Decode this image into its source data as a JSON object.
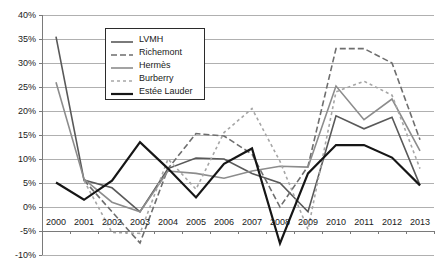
{
  "chart_data": {
    "type": "line",
    "title": "",
    "xlabel": "",
    "ylabel": "",
    "grid": true,
    "legend_position": "top-center-inside",
    "categories": [
      "2000",
      "2001",
      "2002",
      "2003",
      "2004",
      "2005",
      "2006",
      "2007",
      "2008",
      "2009",
      "2010",
      "2011",
      "2012",
      "2013"
    ],
    "x": [
      2000,
      2001,
      2002,
      2003,
      2004,
      2005,
      2006,
      2007,
      2008,
      2009,
      2010,
      2011,
      2012,
      2013
    ],
    "ylim": [
      -10,
      40
    ],
    "ytick_values": [
      40,
      35,
      30,
      25,
      20,
      15,
      10,
      5,
      0,
      -5,
      -10
    ],
    "ytick_labels": [
      "40%",
      "35%",
      "30%",
      "25%",
      "20%",
      "15%",
      "10%",
      "5%",
      "0%",
      "-5%",
      "-10%"
    ],
    "xtick_labels": [
      "2000",
      "2001",
      "2002",
      "2003",
      "2004",
      "2005",
      "2006",
      "2007",
      "2008",
      "2009",
      "2010",
      "2011",
      "2012",
      "2013"
    ],
    "series": [
      {
        "name": "LVMH",
        "color": "#595959",
        "dash": "solid",
        "width": 1.6,
        "values": [
          35.5,
          5.6,
          4.0,
          -1.0,
          8.0,
          10.2,
          10.0,
          7.0,
          5.0,
          -1.0,
          19.0,
          16.3,
          18.7,
          4.5
        ]
      },
      {
        "name": "Richemont",
        "color": "#6e6e6e",
        "dash": "dashed",
        "width": 1.6,
        "values": [
          null,
          5.6,
          -1.0,
          -7.5,
          8.0,
          15.3,
          14.8,
          11.0,
          0.0,
          8.5,
          33.0,
          33.0,
          30.0,
          14.0
        ]
      },
      {
        "name": "Hermès",
        "color": "#8c8c8c",
        "dash": "solid",
        "width": 1.6,
        "values": [
          26.0,
          5.8,
          1.0,
          -1.0,
          7.5,
          7.0,
          6.0,
          7.5,
          8.5,
          8.3,
          25.2,
          18.2,
          22.5,
          11.7
        ]
      },
      {
        "name": "Burberry",
        "color": "#a6a6a6",
        "dash": "dotted",
        "width": 1.6,
        "values": [
          null,
          5.5,
          -5.3,
          -5.5,
          10.0,
          3.7,
          15.5,
          20.5,
          9.5,
          -4.7,
          24.0,
          26.2,
          23.3,
          8.0
        ]
      },
      {
        "name": "Estée Lauder",
        "color": "#161616",
        "dash": "solid",
        "width": 2.2,
        "values": [
          5.1,
          1.5,
          5.5,
          13.5,
          8.0,
          2.0,
          9.0,
          12.2,
          -7.6,
          7.0,
          12.9,
          12.9,
          10.3,
          4.5
        ]
      }
    ],
    "legend": [
      {
        "label": "LVMH",
        "color": "#595959",
        "dash": "solid",
        "width": 1.6
      },
      {
        "label": "Richemont",
        "color": "#6e6e6e",
        "dash": "dashed",
        "width": 1.6
      },
      {
        "label": "Hermès",
        "color": "#8c8c8c",
        "dash": "solid",
        "width": 1.6
      },
      {
        "label": "Burberry",
        "color": "#a6a6a6",
        "dash": "dotted",
        "width": 1.6
      },
      {
        "label": "Estée Lauder",
        "color": "#161616",
        "dash": "solid",
        "width": 2.2
      }
    ],
    "colors": {
      "grid": "#b0b0b0",
      "axis": "#7a7a7a",
      "text": "#1a1a1a",
      "background": "#ffffff",
      "legend_border": "#2b2b2b"
    }
  },
  "geometry": {
    "plot_left": 42,
    "plot_right": 434,
    "plot_top": 15,
    "plot_bottom": 255,
    "legend": {
      "left": 105,
      "top": 28,
      "width": 100,
      "height": 72
    }
  }
}
